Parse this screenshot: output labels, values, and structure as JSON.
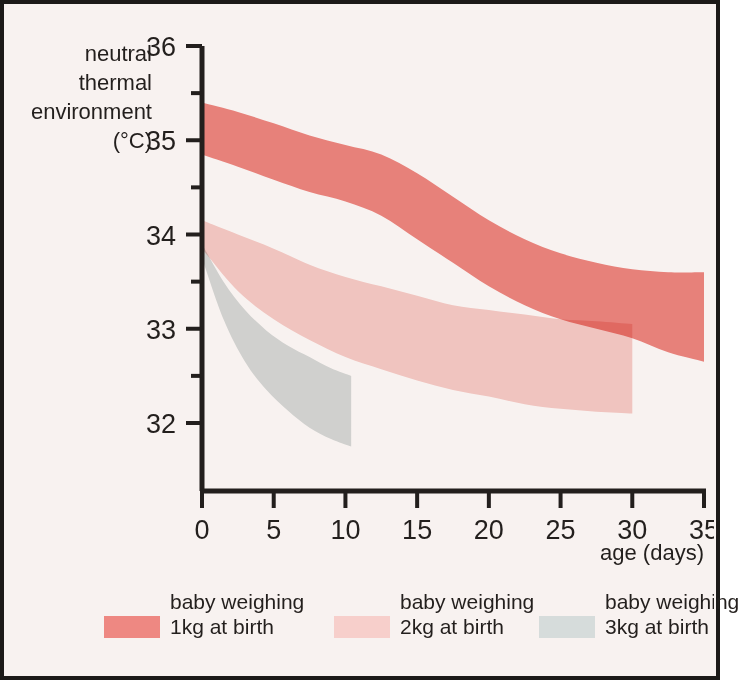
{
  "figure": {
    "background_color": "#f8f2f0",
    "border_color": "#1c1a18",
    "axis_color": "#231f1d"
  },
  "chart_data": {
    "type": "area",
    "title": "",
    "subtitle": "",
    "xlabel": "age (days)",
    "ylabel": "neutral thermal environment (°C)",
    "ylabel_lines": [
      "neutral",
      "thermal",
      "environment",
      "(°C)"
    ],
    "xlim": [
      0,
      35
    ],
    "ylim": [
      31.6,
      36
    ],
    "grid": false,
    "legend_position": "bottom",
    "xticks": [
      0,
      5,
      10,
      15,
      20,
      25,
      30,
      35
    ],
    "xtick_labels": [
      "0",
      "5",
      "10",
      "15",
      "20",
      "25",
      "30",
      "35"
    ],
    "yticks": [
      32,
      33,
      34,
      35,
      36
    ],
    "ytick_labels": [
      "32",
      "33",
      "34",
      "35",
      "36"
    ],
    "yticks_minor": [
      32.5,
      33.5,
      34.5,
      35.5
    ],
    "series": [
      {
        "name": "baby weighing 1kg at birth",
        "legend_line1": "baby weighing",
        "legend_line2": "1kg at birth",
        "color": "#ee8882",
        "x": [
          0,
          2.5,
          5,
          7.5,
          10,
          12.5,
          15,
          17.5,
          20,
          22.5,
          25,
          27.5,
          30,
          32.5,
          35
        ],
        "upper": [
          35.4,
          35.3,
          35.18,
          35.05,
          34.95,
          34.85,
          34.65,
          34.4,
          34.15,
          33.95,
          33.8,
          33.7,
          33.63,
          33.6,
          33.6
        ],
        "lower": [
          34.85,
          34.72,
          34.58,
          34.45,
          34.35,
          34.2,
          33.95,
          33.7,
          33.45,
          33.25,
          33.1,
          33.0,
          32.9,
          32.75,
          32.65
        ]
      },
      {
        "name": "baby weighing 2kg at birth",
        "legend_line1": "baby weighing",
        "legend_line2": "2kg at birth",
        "color": "#f7cfcb",
        "x": [
          0,
          2.5,
          5,
          7.5,
          10,
          12.5,
          15,
          17.5,
          20,
          22.5,
          25,
          27.5,
          30
        ],
        "upper": [
          34.15,
          34.0,
          33.85,
          33.68,
          33.55,
          33.45,
          33.35,
          33.25,
          33.2,
          33.15,
          33.1,
          33.08,
          33.05
        ],
        "lower": [
          33.85,
          33.4,
          33.1,
          32.88,
          32.7,
          32.57,
          32.45,
          32.35,
          32.28,
          32.2,
          32.15,
          32.12,
          32.1
        ]
      },
      {
        "name": "baby weighing 3kg at birth",
        "legend_line1": "baby weighing",
        "legend_line2": "3kg at birth",
        "color": "#d6dcdb",
        "x": [
          0,
          1.5,
          3,
          4.5,
          6,
          7.5,
          9,
          10.4
        ],
        "upper": [
          33.9,
          33.5,
          33.2,
          32.98,
          32.82,
          32.7,
          32.58,
          32.5
        ],
        "lower": [
          33.75,
          33.1,
          32.65,
          32.35,
          32.13,
          31.95,
          31.83,
          31.75
        ]
      }
    ]
  },
  "legend": {
    "entries": [
      {
        "line1": "baby weighing",
        "line2": "1kg at birth",
        "color": "#ee8882"
      },
      {
        "line1": "baby weighing",
        "line2": "2kg at birth",
        "color": "#f7cfcb"
      },
      {
        "line1": "baby weighing",
        "line2": "3kg at birth",
        "color": "#d6dcdb"
      }
    ]
  }
}
